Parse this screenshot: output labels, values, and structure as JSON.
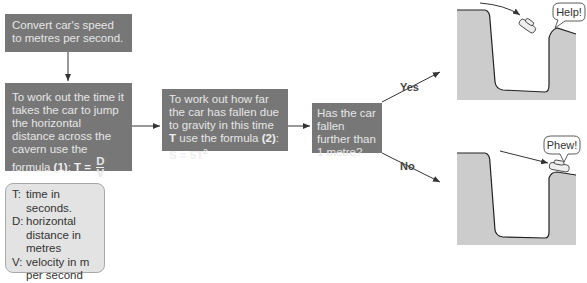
{
  "steps": {
    "step1": {
      "text": "Convert car's speed to metres per second."
    },
    "step2": {
      "text": "To work out the time it takes the car to jump the horizontal distance across the cavern use the formula",
      "formula_number": "(1)",
      "formula_lhs": "T =",
      "numerator": "D",
      "denominator": "V"
    },
    "step3": {
      "text": "To work out how far the car has fallen due to gravity in this time",
      "var": "T",
      "text2": "use the formula",
      "formula_number": "(2)",
      "formula": "S = 5T",
      "exponent": "2"
    },
    "decision": {
      "text": "Has the car fallen further than 1 metre?"
    }
  },
  "branches": {
    "yes": "Yes",
    "no": "No"
  },
  "illustrations": {
    "yes_bubble": "Help!",
    "no_bubble": "Phew!"
  },
  "legend": [
    {
      "key": "T:",
      "desc": "time in seconds."
    },
    {
      "key": "D:",
      "desc": "horizontal distance in metres"
    },
    {
      "key": "V:",
      "desc": "velocity in m per second"
    }
  ],
  "colors": {
    "box_fill": "#777777",
    "box_text": "#e6e6e6",
    "legend_fill": "#e3e3e3",
    "cavern_fill": "#cccccc",
    "line": "#333333"
  }
}
